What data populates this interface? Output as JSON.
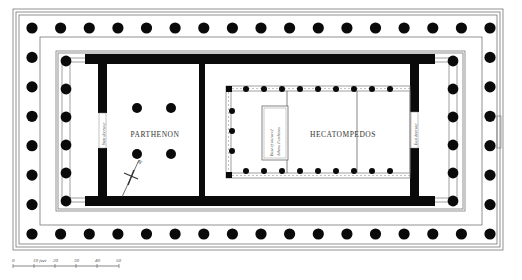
{
  "diagram": {
    "rooms": {
      "parthenon": "PARTHENON",
      "hecatompedos": "HECATOMPEDOS"
    },
    "labels": {
      "west_doorway": "West doorway",
      "east_doorway": "East doorway",
      "statue_base_line1": "Base of statue of",
      "statue_base_line2": "Athena Parthenos"
    },
    "north_arrow": {
      "label": "N"
    },
    "scale_bar": {
      "unit": "feet",
      "ticks": [
        "0",
        "10 feet",
        "20",
        "30",
        "40",
        "50"
      ]
    },
    "columns": {
      "peristyle_long_side_count": 17,
      "peristyle_short_side_count": 8,
      "porch_columns_each_end": 6,
      "parthenon_room_interior_columns": 4
    },
    "colors": {
      "wall": "#0a0a0a",
      "line": "#777777",
      "background": "#ffffff"
    }
  }
}
